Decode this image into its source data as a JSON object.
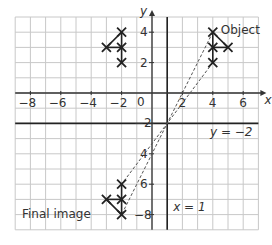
{
  "figure": {
    "axes": {
      "x_label": "x",
      "y_label": "y",
      "origin_label": "0",
      "x_ticks": [
        {
          "value": -8,
          "label": "−8"
        },
        {
          "value": -6,
          "label": "−6"
        },
        {
          "value": -4,
          "label": "−4"
        },
        {
          "value": -2,
          "label": "−2"
        },
        {
          "value": 2,
          "label": "2"
        },
        {
          "value": 4,
          "label": "4"
        },
        {
          "value": 6,
          "label": "6"
        }
      ],
      "y_ticks": [
        {
          "value": 4,
          "label": "4"
        },
        {
          "value": 2,
          "label": "2"
        },
        {
          "value": -2,
          "label": "−2"
        },
        {
          "value": -4,
          "label": "4"
        },
        {
          "value": -6,
          "label": "6"
        },
        {
          "value": -8,
          "label": "−8"
        }
      ],
      "x_range": [
        -9,
        7
      ],
      "y_range": [
        -9,
        5
      ]
    },
    "mirror_lines": [
      {
        "equation": "x = 1",
        "type": "vertical",
        "value": 1
      },
      {
        "equation": "y = −2",
        "type": "horizontal",
        "value": -2
      }
    ],
    "shapes": [
      {
        "name": "Object",
        "label": "Object",
        "points": [
          [
            4,
            4
          ],
          [
            4,
            3
          ],
          [
            5,
            3
          ],
          [
            4,
            2
          ]
        ]
      },
      {
        "name": "First image",
        "label": "",
        "points": [
          [
            -2,
            4
          ],
          [
            -2,
            3
          ],
          [
            -3,
            3
          ],
          [
            -2,
            2
          ]
        ]
      },
      {
        "name": "Final image",
        "label": "Final image",
        "points": [
          [
            -2,
            -8
          ],
          [
            -2,
            -7
          ],
          [
            -3,
            -7
          ],
          [
            -2,
            -6
          ]
        ]
      }
    ],
    "dashed_connectors": [
      {
        "from": [
          4,
          4
        ],
        "to": [
          -2,
          -8
        ]
      },
      {
        "from": [
          4,
          2
        ],
        "to": [
          -2,
          -6
        ]
      }
    ],
    "labels": {
      "object": "Object",
      "final_image": "Final image",
      "x_eq_1": "x = 1",
      "y_eq_neg2": "y = −2"
    },
    "colors": {
      "grid": "#c8c8c8",
      "axis": "#333333",
      "mirror": "#222222",
      "cross": "#222222",
      "dashed": "#555555"
    }
  }
}
